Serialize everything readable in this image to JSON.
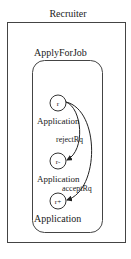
{
  "outer": {
    "title": "Recruiter"
  },
  "inner": {
    "title": "ApplyForJob"
  },
  "states": [
    {
      "id": "r",
      "label": "r",
      "caption": "Application"
    },
    {
      "id": "r-",
      "label": "r-",
      "caption": "Application"
    },
    {
      "id": "r+",
      "label": "r+",
      "caption": "Application"
    }
  ],
  "transitions": [
    {
      "from": "r",
      "to": "r-",
      "label": "rejectRq"
    },
    {
      "from": "r",
      "to": "r+",
      "label": "acceptRq"
    }
  ]
}
